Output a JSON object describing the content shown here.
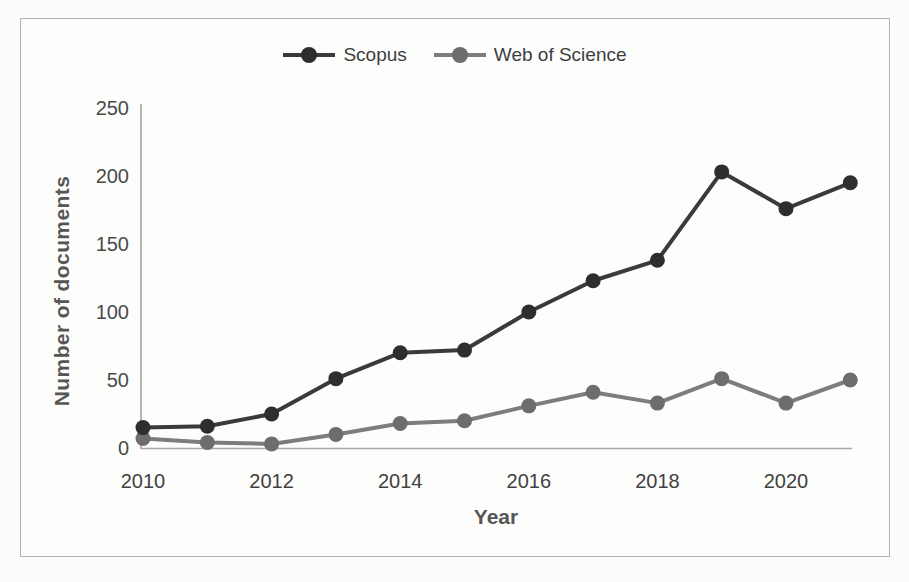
{
  "figure": {
    "border_color": "#b2b2b2",
    "background": "#fdfdfc"
  },
  "legend": {
    "position": "top"
  },
  "axes": {
    "y_title": "Number of documents",
    "x_title": "Year"
  },
  "chart_data": {
    "type": "line",
    "xlabel": "Year",
    "ylabel": "Number of documents",
    "x": [
      2010,
      2011,
      2012,
      2013,
      2014,
      2015,
      2016,
      2017,
      2018,
      2019,
      2020,
      2021
    ],
    "xticks": [
      2010,
      2012,
      2014,
      2016,
      2018,
      2020
    ],
    "yticks": [
      0,
      50,
      100,
      150,
      200,
      250
    ],
    "ylim": [
      0,
      250
    ],
    "grid": false,
    "legend_position": "top",
    "series": [
      {
        "name": "Scopus",
        "color": "#3a3a3a",
        "marker_color": "#2e2e2e",
        "marker": "circle",
        "values": [
          15,
          16,
          25,
          51,
          70,
          72,
          100,
          123,
          138,
          203,
          176,
          195
        ]
      },
      {
        "name": "Web of Science",
        "color": "#7d7d7d",
        "marker_color": "#6d6d6d",
        "marker": "circle",
        "values": [
          7,
          4,
          3,
          10,
          18,
          20,
          31,
          41,
          33,
          51,
          33,
          50
        ]
      }
    ]
  }
}
